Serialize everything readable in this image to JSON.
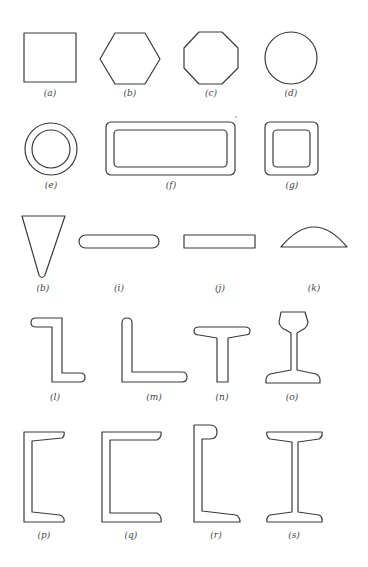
{
  "figure": {
    "stroke_color": "#3a3a3a",
    "background": "#ffffff",
    "items": [
      {
        "id": "a",
        "label": "(a)",
        "shape": "square",
        "label_x": 50,
        "label_y": 95
      },
      {
        "id": "b",
        "label": "(b)",
        "shape": "hexagon",
        "label_x": 130,
        "label_y": 95
      },
      {
        "id": "c",
        "label": "(c)",
        "shape": "octagon",
        "label_x": 211,
        "label_y": 95
      },
      {
        "id": "d",
        "label": "(d)",
        "shape": "circle",
        "label_x": 291,
        "label_y": 95
      },
      {
        "id": "e",
        "label": "(e)",
        "shape": "ring",
        "label_x": 51,
        "label_y": 185
      },
      {
        "id": "f",
        "label": "(f)",
        "shape": "hollow-rectangle",
        "label_x": 171,
        "label_y": 185
      },
      {
        "id": "g",
        "label": "(g)",
        "shape": "hollow-square",
        "label_x": 292,
        "label_y": 185
      },
      {
        "id": "h",
        "label": "(b)",
        "shape": "wedge",
        "label_x": 43,
        "label_y": 288
      },
      {
        "id": "i",
        "label": "(i)",
        "shape": "rounded-bar",
        "label_x": 119,
        "label_y": 288
      },
      {
        "id": "j",
        "label": "(j)",
        "shape": "flat-bar",
        "label_x": 220,
        "label_y": 288
      },
      {
        "id": "k",
        "label": "(k)",
        "shape": "circular-segment",
        "label_x": 314,
        "label_y": 288
      },
      {
        "id": "l",
        "label": "(l)",
        "shape": "z-section",
        "label_x": 55,
        "label_y": 391
      },
      {
        "id": "m",
        "label": "(m)",
        "shape": "angle-section",
        "label_x": 154,
        "label_y": 391
      },
      {
        "id": "n",
        "label": "(n)",
        "shape": "t-section",
        "label_x": 222,
        "label_y": 391
      },
      {
        "id": "o",
        "label": "(o)",
        "shape": "rail-section",
        "label_x": 292,
        "label_y": 391
      },
      {
        "id": "p",
        "label": "(p)",
        "shape": "channel-tapered",
        "label_x": 44,
        "label_y": 530
      },
      {
        "id": "q",
        "label": "(q)",
        "shape": "channel",
        "label_x": 131,
        "label_y": 530
      },
      {
        "id": "r",
        "label": "(r)",
        "shape": "bulb-channel",
        "label_x": 216,
        "label_y": 530
      },
      {
        "id": "s",
        "label": "(s)",
        "shape": "i-beam",
        "label_x": 294,
        "label_y": 530
      }
    ]
  }
}
